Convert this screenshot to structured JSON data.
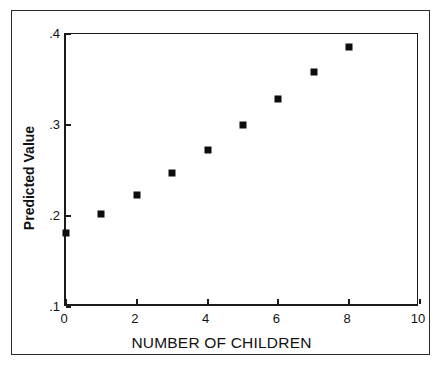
{
  "figure": {
    "background_color": "#ffffff",
    "frame_color": "#2b2b2b",
    "axis_color": "#1a1a1a",
    "marker_color": "#0d0d0d"
  },
  "chart_data": {
    "type": "scatter",
    "title": "",
    "subtitle": "",
    "xlabel": "NUMBER OF CHILDREN",
    "ylabel": "Predicted Value",
    "xlim": [
      0,
      10
    ],
    "ylim": [
      0.1,
      0.4
    ],
    "grid": false,
    "legend": null,
    "marker": "filled-square",
    "x": [
      0,
      1,
      2,
      3,
      4,
      5,
      6,
      7,
      8
    ],
    "y": [
      0.181,
      0.202,
      0.223,
      0.247,
      0.272,
      0.3,
      0.329,
      0.358,
      0.386
    ],
    "xticks": [
      0,
      2,
      4,
      6,
      8,
      10
    ],
    "xtick_labels": [
      "0",
      "2",
      "4",
      "6",
      "8",
      "10"
    ],
    "yticks": [
      0.1,
      0.2,
      0.3,
      0.4
    ],
    "ytick_labels": [
      ".1",
      ".2",
      ".3",
      ".4"
    ],
    "series": [
      {
        "name": "Predicted Value",
        "points": [
          {
            "x": 0,
            "y": 0.181
          },
          {
            "x": 1,
            "y": 0.202
          },
          {
            "x": 2,
            "y": 0.223
          },
          {
            "x": 3,
            "y": 0.247
          },
          {
            "x": 4,
            "y": 0.272
          },
          {
            "x": 5,
            "y": 0.3
          },
          {
            "x": 6,
            "y": 0.329
          },
          {
            "x": 7,
            "y": 0.358
          },
          {
            "x": 8,
            "y": 0.386
          }
        ]
      }
    ]
  }
}
